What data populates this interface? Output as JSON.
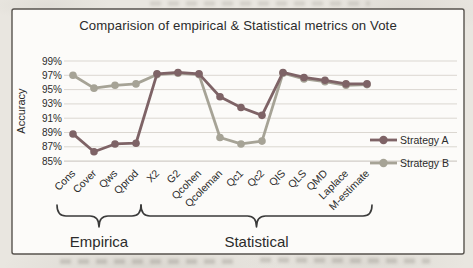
{
  "chart_data": {
    "type": "line",
    "title": "Comparision of empirical & Statistical metrics on Vote",
    "ylabel": "Accuracy",
    "categories": [
      "Cons",
      "Cover",
      "Qws",
      "Qprod",
      "X2",
      "G2",
      "Qcohen",
      "Qcoleman",
      "Qc1",
      "Qc2",
      "QIS",
      "QLS",
      "QMD",
      "Laplace",
      "M-estimate"
    ],
    "series": [
      {
        "name": "Strategy A",
        "color": "#7E6366",
        "values": [
          88.8,
          86.3,
          87.4,
          87.5,
          97.2,
          97.4,
          97.2,
          94.0,
          92.5,
          91.4,
          97.4,
          96.7,
          96.3,
          95.8,
          95.8
        ]
      },
      {
        "name": "Strategy B",
        "color": "#A6A396",
        "values": [
          97.0,
          95.2,
          95.6,
          95.8,
          97.1,
          97.3,
          97.1,
          88.3,
          87.4,
          87.8,
          97.3,
          96.5,
          96.1,
          95.6,
          95.7
        ]
      }
    ],
    "ylim": [
      85,
      99
    ],
    "ytick_step": 2,
    "ytick_suffix": "%",
    "grid": "horizontal",
    "legend_position": "right",
    "groups": [
      {
        "label": "Empirica",
        "from": 0,
        "to": 3
      },
      {
        "label": "Statistical",
        "from": 4,
        "to": 14
      }
    ]
  }
}
